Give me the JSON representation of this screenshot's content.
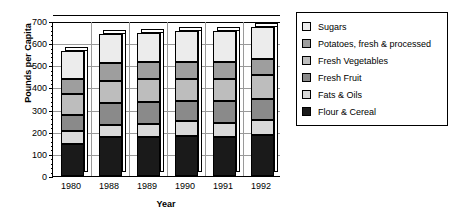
{
  "chart_data": {
    "type": "bar",
    "stacked": true,
    "title": "",
    "xlabel": "Year",
    "ylabel": "Pounds per Capita",
    "categories": [
      "1980",
      "1988",
      "1989",
      "1990",
      "1991",
      "1992"
    ],
    "ylim": [
      0,
      700
    ],
    "yticks": [
      0,
      100,
      200,
      300,
      400,
      500,
      600,
      700
    ],
    "grid": true,
    "legend_position": "right",
    "series": [
      {
        "name": "Flour & Cereal",
        "color": "#1a1a1a",
        "values": [
          145,
          175,
          178,
          182,
          178,
          185
        ]
      },
      {
        "name": "Fats & Oils",
        "color": "#d9d9d9",
        "values": [
          60,
          55,
          55,
          68,
          62,
          70
        ]
      },
      {
        "name": "Fresh Fruit",
        "color": "#8a8a8a",
        "values": [
          70,
          100,
          100,
          90,
          100,
          95
        ]
      },
      {
        "name": "Fresh Vegetables",
        "color": "#bdbdbd",
        "values": [
          95,
          100,
          105,
          100,
          100,
          105
        ]
      },
      {
        "name": "Potatoes, fresh & processed",
        "color": "#9e9e9e",
        "values": [
          70,
          80,
          75,
          75,
          75,
          75
        ]
      },
      {
        "name": "Sugars",
        "color": "#ececec",
        "values": [
          125,
          130,
          135,
          140,
          140,
          145
        ]
      }
    ],
    "totals": [
      565,
      640,
      648,
      655,
      655,
      675
    ]
  },
  "legend": {
    "items": [
      {
        "label": "Sugars",
        "color": "#ececec"
      },
      {
        "label": "Potatoes, fresh & processed",
        "color": "#9e9e9e"
      },
      {
        "label": "Fresh Vegetables",
        "color": "#bdbdbd"
      },
      {
        "label": "Fresh Fruit",
        "color": "#8a8a8a"
      },
      {
        "label": "Fats & Oils",
        "color": "#d9d9d9"
      },
      {
        "label": "Flour & Cereal",
        "color": "#1a1a1a"
      }
    ]
  }
}
